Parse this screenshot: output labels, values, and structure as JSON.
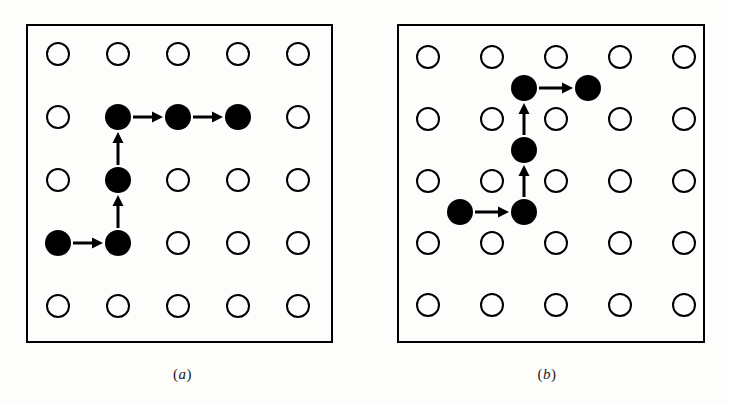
{
  "figure": {
    "background_color": "#fdfdfc",
    "ink_color": "#000000",
    "panel_count": 2
  },
  "panels": [
    {
      "id": "a",
      "caption": "(a)",
      "caption_paren_open": "(",
      "caption_letter": "a",
      "caption_paren_close": ")",
      "box": {
        "x": 26,
        "y": 24,
        "width": 307,
        "height": 319,
        "stroke_width": 2
      },
      "grid": {
        "rows": 5,
        "cols": 5,
        "origin_x": 58,
        "origin_y": 54,
        "dx": 60,
        "dy": 63,
        "open_radius": 11,
        "open_stroke_width": 2
      },
      "lattice_type": "on-site",
      "filled_radius": 13,
      "nodes": [
        {
          "label": "start",
          "col": 1,
          "row": 4
        },
        {
          "label": "n2",
          "col": 2,
          "row": 4
        },
        {
          "label": "n3",
          "col": 2,
          "row": 3
        },
        {
          "label": "n4",
          "col": 2,
          "row": 2
        },
        {
          "label": "n5",
          "col": 3,
          "row": 2
        },
        {
          "label": "end",
          "col": 4,
          "row": 2
        }
      ],
      "arrows": [
        {
          "from": [
            1,
            4
          ],
          "to": [
            2,
            4
          ],
          "direction": "right"
        },
        {
          "from": [
            2,
            4
          ],
          "to": [
            2,
            3
          ],
          "direction": "up"
        },
        {
          "from": [
            2,
            3
          ],
          "to": [
            2,
            2
          ],
          "direction": "up"
        },
        {
          "from": [
            2,
            2
          ],
          "to": [
            3,
            2
          ],
          "direction": "right"
        },
        {
          "from": [
            3,
            2
          ],
          "to": [
            4,
            2
          ],
          "direction": "right"
        }
      ]
    },
    {
      "id": "b",
      "caption": "(b)",
      "caption_paren_open": "(",
      "caption_letter": "b",
      "caption_paren_close": ")",
      "box": {
        "x": 397,
        "y": 24,
        "width": 308,
        "height": 319,
        "stroke_width": 2
      },
      "grid": {
        "rows": 5,
        "cols": 5,
        "origin_x": 428,
        "origin_y": 57,
        "dx": 64,
        "dy": 62,
        "open_radius": 11,
        "open_stroke_width": 2
      },
      "lattice_type": "interstitial",
      "filled_radius": 13,
      "nodes": [
        {
          "label": "start",
          "col": 1.5,
          "row": 3.5
        },
        {
          "label": "n2",
          "col": 2.5,
          "row": 3.5
        },
        {
          "label": "n3",
          "col": 2.5,
          "row": 2.5
        },
        {
          "label": "n4",
          "col": 2.5,
          "row": 1.5
        },
        {
          "label": "end",
          "col": 3.5,
          "row": 1.5
        }
      ],
      "arrows": [
        {
          "from": [
            1.5,
            3.5
          ],
          "to": [
            2.5,
            3.5
          ],
          "direction": "right"
        },
        {
          "from": [
            2.5,
            3.5
          ],
          "to": [
            2.5,
            2.5
          ],
          "direction": "up"
        },
        {
          "from": [
            2.5,
            2.5
          ],
          "to": [
            2.5,
            1.5
          ],
          "direction": "up"
        },
        {
          "from": [
            2.5,
            1.5
          ],
          "to": [
            3.5,
            1.5
          ],
          "direction": "right"
        }
      ]
    }
  ],
  "arrow_style": {
    "shaft_width": 3,
    "head_length": 11,
    "head_width": 11,
    "gap_from_node": 15
  }
}
